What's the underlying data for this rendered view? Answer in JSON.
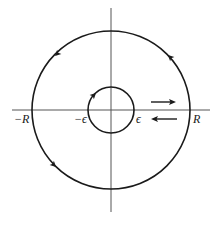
{
  "diagram": {
    "type": "keyhole-like annulus contour",
    "colors": {
      "stroke": "#1a1a1a",
      "background": "#ffffff"
    },
    "labels": {
      "neg_R": "−R",
      "neg_eps": "−ϵ",
      "eps": "ϵ",
      "R": "R"
    },
    "outer_circle": {
      "radius_label": "R",
      "orientation": "counterclockwise"
    },
    "inner_circle": {
      "radius_label": "ϵ",
      "orientation": "clockwise"
    },
    "segment_arrows": [
      "right (upper)",
      "left (lower)"
    ]
  }
}
